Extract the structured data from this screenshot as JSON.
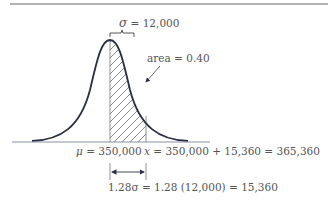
{
  "diagram": {
    "type": "normal-distribution",
    "sigma_label": "σ",
    "sigma_value": "= 12,000",
    "area_label": "area = 0.40",
    "mu_symbol": "μ",
    "mu_value": "= 350,000",
    "x_symbol": "x",
    "x_value": "= 350,000 + 15,360 = 365,360",
    "z_symbol": "1.28σ",
    "z_value": "= 1.28 (12,000) = 15,360",
    "colors": {
      "curve": "#2a2f45",
      "rule": "#555555",
      "hatch": "#555555",
      "text": "#555555"
    }
  }
}
